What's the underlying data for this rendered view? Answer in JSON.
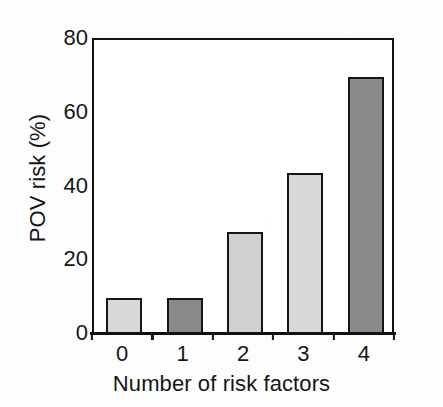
{
  "chart_data": {
    "type": "bar",
    "title": "",
    "subtitle": "",
    "xlabel": "Number of risk factors",
    "ylabel": "POV risk (%)",
    "categories": [
      "0",
      "1",
      "2",
      "3",
      "4"
    ],
    "values": [
      10,
      10,
      28,
      44,
      70
    ],
    "series": [
      {
        "name": "POV risk",
        "values": [
          10,
          10,
          28,
          44,
          70
        ]
      }
    ],
    "bar_colors": [
      "#d8d8d8",
      "#8a8a8a",
      "#d0d0d0",
      "#d8d8d8",
      "#8a8a8a"
    ],
    "bar_edge_color": "#151515",
    "ylim": [
      0,
      80
    ],
    "yticks": [
      0,
      20,
      40,
      60,
      80
    ],
    "ytick_labels": [
      "0",
      "20",
      "40",
      "60",
      "80"
    ],
    "xtick_labels": [
      "0",
      "1",
      "2",
      "3",
      "4"
    ],
    "grid": false,
    "legend": null,
    "legend_position": "none",
    "annotations": [],
    "axis_color": "#111111",
    "plot_background": "#ffffff",
    "figure_background": "#fdfdfd"
  }
}
